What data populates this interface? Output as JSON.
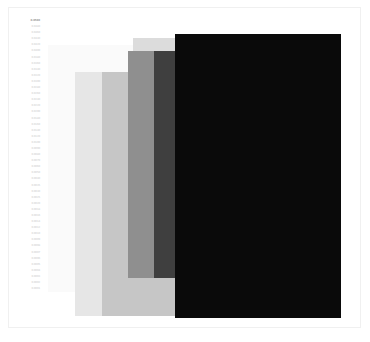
{
  "figure": {
    "title": "",
    "background_color": "#ffffff",
    "frame_color": "#f0f0f0"
  },
  "chart_data": {
    "type": "bar",
    "title": "",
    "subtitle": "",
    "xlabel": "",
    "ylabel": "",
    "grid": false,
    "legend_position": "none",
    "orientation": "overlapping-rectangles",
    "note": "Six overlapping semi-transparent gray rectangles rendered back-to-front with increasing darkness; y-axis shows a dense column of very small light-gray tick labels.",
    "categories": [
      "R1",
      "R2",
      "R3",
      "R4",
      "R5",
      "R6"
    ],
    "values": [
      292,
      316,
      300,
      278,
      318,
      318
    ],
    "series": [
      {
        "name": "rectangles",
        "values": [
          292,
          316,
          300,
          278,
          318,
          318
        ]
      }
    ],
    "rectangles": [
      {
        "name": "rect-1",
        "x": 48,
        "y": 45,
        "width": 166,
        "height": 247,
        "color": "#fafafa",
        "opacity": 1
      },
      {
        "name": "rect-2",
        "x": 75,
        "y": 72,
        "width": 166,
        "height": 244,
        "color": "#e6e6e6",
        "opacity": 1
      },
      {
        "name": "rect-3",
        "x": 133,
        "y": 38,
        "width": 166,
        "height": 262,
        "color": "#dcdcdc",
        "opacity": 1
      },
      {
        "name": "rect-4",
        "x": 102,
        "y": 72,
        "width": 166,
        "height": 244,
        "color": "#c6c6c6",
        "opacity": 1
      },
      {
        "name": "rect-5",
        "x": 128,
        "y": 51,
        "width": 202,
        "height": 227,
        "color": "#8f8f8f",
        "opacity": 1
      },
      {
        "name": "rect-6",
        "x": 154,
        "y": 51,
        "width": 176,
        "height": 227,
        "color": "#3f3f3f",
        "opacity": 1
      },
      {
        "name": "rect-7",
        "x": 175,
        "y": 34,
        "width": 166,
        "height": 284,
        "color": "#0a0a0a",
        "opacity": 1
      }
    ],
    "xlim": [
      0,
      370
    ],
    "ylim": [
      0,
      342
    ],
    "ytick_labels": [
      "0.0500",
      "0.0480",
      "0.0460",
      "0.0440",
      "0.0420",
      "0.0400",
      "0.0380",
      "0.0360",
      "0.0340",
      "0.0320",
      "0.0300",
      "0.0280",
      "0.0260",
      "0.0240",
      "0.0220",
      "0.0200",
      "0.0180",
      "0.0160",
      "0.0140",
      "0.0120",
      "0.0100",
      "0.0090",
      "0.0080",
      "0.0070",
      "0.0060",
      "0.0050",
      "0.0040",
      "0.0035",
      "0.0030",
      "0.0025",
      "0.0020",
      "0.0018",
      "0.0016",
      "0.0014",
      "0.0012",
      "0.0010",
      "0.0009",
      "0.0008",
      "0.0007",
      "0.0006",
      "0.0005",
      "0.0004",
      "0.0003",
      "0.0002",
      "0.0001"
    ]
  }
}
